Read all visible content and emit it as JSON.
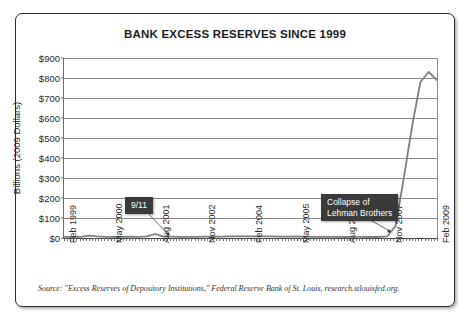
{
  "chart": {
    "title": "BANK EXCESS RESERVES SINCE 1999",
    "source": "Source: \"Excess Reserves of Depository Institutions,\" Federal Reserve Bank of St. Louis, research.stlouisfed.org."
  },
  "annotations": {
    "a911": "9/11",
    "lehman": "Collapse of\nLehman Brothers"
  },
  "chart_data": {
    "type": "line",
    "title": "BANK EXCESS RESERVES SINCE 1999",
    "xlabel": "",
    "ylabel": "Billions (2009 Dollars)",
    "ylim": [
      0,
      900
    ],
    "ytick_labels": [
      "$900",
      "$800",
      "$700",
      "$600",
      "$500",
      "$400",
      "$300",
      "$200",
      "$100",
      "$0"
    ],
    "ytick_values": [
      900,
      800,
      700,
      600,
      500,
      400,
      300,
      200,
      100,
      0
    ],
    "xtick_labels": [
      "Feb 1999",
      "May 2000",
      "Aug 2001",
      "Nov 2002",
      "Feb 2004",
      "May 2005",
      "Aug 2006",
      "Nov 2007",
      "Feb 2009"
    ],
    "grid": "horizontal",
    "legend": "none",
    "line_color": "#7f7f7f",
    "series": [
      {
        "name": "Excess reserves",
        "x": [
          "Feb 1999",
          "May 1999",
          "Aug 1999",
          "Nov 1999",
          "Feb 2000",
          "May 2000",
          "Aug 2000",
          "Nov 2000",
          "Feb 2001",
          "May 2001",
          "Aug 2001",
          "Sep 2001",
          "Nov 2001",
          "Feb 2002",
          "May 2002",
          "Aug 2002",
          "Nov 2002",
          "Feb 2003",
          "May 2003",
          "Aug 2003",
          "Nov 2003",
          "Feb 2004",
          "May 2004",
          "Aug 2004",
          "Nov 2004",
          "Feb 2005",
          "May 2005",
          "Aug 2005",
          "Nov 2005",
          "Feb 2006",
          "May 2006",
          "Aug 2006",
          "Nov 2006",
          "Feb 2007",
          "May 2007",
          "Aug 2007",
          "Nov 2007",
          "Feb 2008",
          "May 2008",
          "Aug 2008",
          "Sep 2008",
          "Oct 2008",
          "Nov 2008",
          "Dec 2008",
          "Jan 2009",
          "Feb 2009"
        ],
        "values": [
          6,
          5,
          6,
          12,
          8,
          6,
          6,
          6,
          7,
          6,
          8,
          20,
          7,
          7,
          6,
          6,
          6,
          7,
          7,
          7,
          8,
          8,
          8,
          8,
          8,
          8,
          7,
          7,
          8,
          7,
          6,
          6,
          6,
          6,
          5,
          6,
          6,
          5,
          5,
          8,
          60,
          300,
          560,
          780,
          830,
          790
        ]
      }
    ],
    "annotations": [
      {
        "label": "9/11",
        "x": "Sep 2001",
        "y": 20
      },
      {
        "label": "Collapse of Lehman Brothers",
        "x": "Sep 2008",
        "y": 60
      }
    ]
  }
}
